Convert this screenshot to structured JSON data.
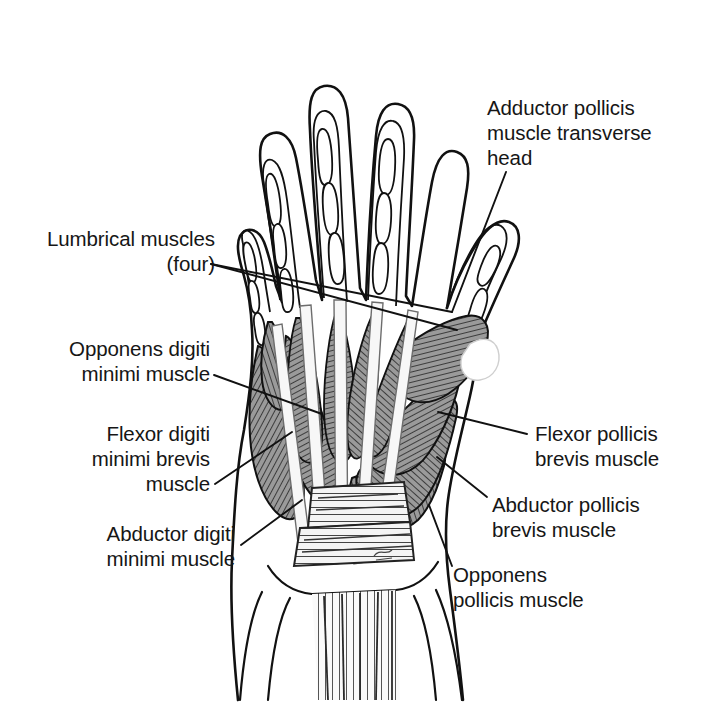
{
  "figure": {
    "kind": "anatomical-illustration",
    "view": "palmar",
    "background_color": "#ffffff",
    "line_color": "#111111",
    "muscle_fill_color": "#8a8a8a",
    "tendon_fill_color": "#f2f2f2",
    "bone_fill_color": "#ffffff"
  },
  "labels": [
    {
      "id": "adductor-pollicis-transverse-head",
      "text": "Adductor pollicis\nmuscle transverse\nhead",
      "align": "left",
      "x": 487,
      "y": 95,
      "leader": [
        [
          506,
          172
        ],
        [
          452,
          312
        ]
      ]
    },
    {
      "id": "lumbrical-muscles",
      "text": "Lumbrical muscles (four)",
      "align": "right",
      "x": 78,
      "y": 226,
      "leader": [
        [
          211,
          264
        ],
        [
          452,
          312
        ]
      ],
      "leader2": [
        [
          211,
          264
        ],
        [
          457,
          328
        ]
      ]
    },
    {
      "id": "opponens-digiti-minimi",
      "text": "Opponens digiti\nminimi muscle",
      "align": "right",
      "x": 33,
      "y": 336,
      "leader": [
        [
          214,
          375
        ],
        [
          320,
          412
        ]
      ]
    },
    {
      "id": "flexor-digiti-minimi-brevis",
      "text": "Flexor digiti\nminimi brevis\nmuscle",
      "align": "right",
      "x": 73,
      "y": 421,
      "leader": [
        [
          215,
          484
        ],
        [
          291,
          432
        ]
      ]
    },
    {
      "id": "abductor-digiti-minimi",
      "text": "Abductor digiti\nminimi muscle",
      "align": "right",
      "x": 63,
      "y": 521,
      "leader": [
        [
          240,
          545
        ],
        [
          300,
          500
        ]
      ]
    },
    {
      "id": "flexor-pollicis-brevis",
      "text": "Flexor pollicis\nbrevis muscle",
      "align": "left",
      "x": 535,
      "y": 421,
      "leader": [
        [
          527,
          434
        ],
        [
          440,
          413
        ]
      ]
    },
    {
      "id": "abductor-pollicis-brevis",
      "text": "Abductor pollicis\nbrevis muscle",
      "align": "left",
      "x": 492,
      "y": 492,
      "leader": [
        [
          487,
          497
        ],
        [
          438,
          458
        ]
      ]
    },
    {
      "id": "opponens-pollicis",
      "text": "Opponens\npollicis muscle",
      "align": "left",
      "x": 453,
      "y": 562,
      "leader": [
        [
          452,
          566
        ],
        [
          430,
          506
        ]
      ]
    }
  ],
  "signature": {
    "text": "",
    "x": 381,
    "y": 553
  }
}
